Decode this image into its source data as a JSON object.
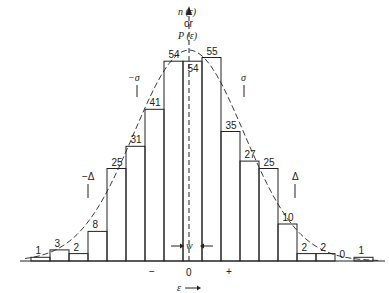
{
  "chart_data": {
    "type": "bar",
    "title": "",
    "ylabel": "n(ε) or P(ε)",
    "xlabel": "ε",
    "bins_counts": [
      1,
      3,
      2,
      8,
      25,
      31,
      41,
      54,
      54,
      55,
      35,
      27,
      25,
      10,
      2,
      2,
      0,
      1
    ],
    "overlay": "Gaussian (dashed) curve",
    "annotations": {
      "minus_sigma": "−σ",
      "plus_sigma": "σ",
      "minus_delta": "−Δ",
      "plus_delta": "Δ",
      "width": "w",
      "zero": "0",
      "minus": "−",
      "plus": "+",
      "epsilon_arrow": "ε"
    },
    "ylabel_lines": [
      "n (ε)",
      "or",
      "P (ε)"
    ]
  }
}
